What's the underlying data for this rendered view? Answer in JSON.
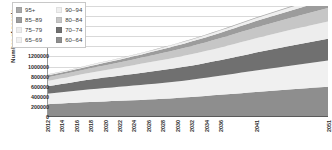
{
  "chart_data": {
    "type": "area",
    "stacked": true,
    "title": "",
    "xlabel": "",
    "ylabel": "Number of people",
    "ylim": [
      0,
      2200000
    ],
    "ytick_step": 200000,
    "yticks": [
      "0",
      "200000",
      "400000",
      "600000",
      "800000",
      "1000000",
      "1200000",
      "1400000",
      "1600000",
      "1800000",
      "2000000",
      "2200000"
    ],
    "grid": true,
    "legend_position": "top-left-inside",
    "x": [
      2012,
      2013,
      2014,
      2015,
      2016,
      2017,
      2018,
      2019,
      2020,
      2021,
      2022,
      2023,
      2024,
      2025,
      2026,
      2027,
      2028,
      2029,
      2030,
      2031,
      2032,
      2033,
      2034,
      2035,
      2036,
      2037,
      2038,
      2039,
      2040,
      2041,
      2046,
      2051
    ],
    "xtick_labels": [
      "2012",
      "2014",
      "2016",
      "2018",
      "2020",
      "2022",
      "2024",
      "2026",
      "2028",
      "2030",
      "2032",
      "2034",
      "2036",
      "2041",
      "2051"
    ],
    "series": [
      {
        "name": "60–64",
        "color": "#8e8e8e",
        "values": [
          255000,
          262000,
          269000,
          276000,
          283000,
          290000,
          297000,
          303000,
          309000,
          315000,
          321000,
          327000,
          333000,
          339000,
          346000,
          353000,
          361000,
          369000,
          378000,
          387000,
          397000,
          407000,
          418000,
          429000,
          440000,
          451000,
          462000,
          473000,
          484000,
          495000,
          548000,
          600000
        ]
      },
      {
        "name": "65–69",
        "color": "#f0f0f0",
        "values": [
          205000,
          213000,
          221000,
          229000,
          237000,
          245000,
          252000,
          259000,
          265000,
          271000,
          277000,
          283000,
          289000,
          295000,
          301000,
          307000,
          313000,
          319000,
          326000,
          333000,
          341000,
          349000,
          358000,
          367000,
          377000,
          387000,
          397000,
          407000,
          417000,
          427000,
          475000,
          520000
        ]
      },
      {
        "name": "70–74",
        "color": "#707070",
        "values": [
          150000,
          156000,
          163000,
          170000,
          178000,
          186000,
          194000,
          201000,
          208000,
          214000,
          220000,
          226000,
          232000,
          238000,
          244000,
          250000,
          256000,
          262000,
          268000,
          274000,
          280000,
          287000,
          294000,
          302000,
          310000,
          318000,
          327000,
          336000,
          345000,
          354000,
          395000,
          430000
        ]
      },
      {
        "name": "75–79",
        "color": "#ededed",
        "values": [
          105000,
          109000,
          113000,
          118000,
          123000,
          129000,
          135000,
          141000,
          147000,
          153000,
          160000,
          167000,
          174000,
          181000,
          188000,
          194000,
          200000,
          206000,
          212000,
          218000,
          224000,
          230000,
          236000,
          242000,
          248000,
          255000,
          262000,
          269000,
          276000,
          283000,
          315000,
          345000
        ]
      },
      {
        "name": "80–84",
        "color": "#c6c6c6",
        "values": [
          70000,
          72000,
          74000,
          77000,
          80000,
          83000,
          86000,
          90000,
          94000,
          98000,
          103000,
          108000,
          113000,
          119000,
          125000,
          131000,
          137000,
          143000,
          149000,
          155000,
          161000,
          167000,
          173000,
          179000,
          185000,
          191000,
          197000,
          203000,
          209000,
          215000,
          240000,
          265000
        ]
      },
      {
        "name": "85–89",
        "color": "#9c9c9c",
        "values": [
          38000,
          39000,
          40000,
          41000,
          43000,
          45000,
          47000,
          49000,
          51000,
          53000,
          55000,
          58000,
          61000,
          64000,
          67000,
          71000,
          75000,
          79000,
          83000,
          87000,
          91000,
          95000,
          99000,
          103000,
          107000,
          111000,
          115000,
          119000,
          123000,
          127000,
          145000,
          165000
        ]
      },
      {
        "name": "90–94",
        "color": "#efefef",
        "values": [
          15000,
          15500,
          16000,
          16500,
          17000,
          18000,
          19000,
          20000,
          21000,
          22000,
          23000,
          24000,
          25000,
          26000,
          27000,
          28000,
          30000,
          32000,
          34000,
          36000,
          38000,
          40000,
          42000,
          44000,
          46000,
          48000,
          50000,
          52000,
          54000,
          56000,
          66000,
          76000
        ]
      },
      {
        "name": "95+",
        "color": "#a8a8a8",
        "values": [
          4000,
          4200,
          4400,
          4600,
          4800,
          5000,
          5200,
          5500,
          5800,
          6100,
          6400,
          6700,
          7000,
          7300,
          7600,
          8000,
          8400,
          8800,
          9200,
          9600,
          10000,
          10500,
          11000,
          11500,
          12000,
          12600,
          13200,
          13800,
          14400,
          15000,
          18000,
          21000
        ]
      }
    ]
  },
  "legend": {
    "items": [
      {
        "label": "95+",
        "color": "#a8a8a8"
      },
      {
        "label": "90–94",
        "color": "#efefef"
      },
      {
        "label": "85–89",
        "color": "#9c9c9c"
      },
      {
        "label": "80–84",
        "color": "#c6c6c6"
      },
      {
        "label": "75–79",
        "color": "#ededed"
      },
      {
        "label": "70–74",
        "color": "#707070"
      },
      {
        "label": "65–69",
        "color": "#f0f0f0"
      },
      {
        "label": "60–64",
        "color": "#8e8e8e"
      }
    ]
  }
}
